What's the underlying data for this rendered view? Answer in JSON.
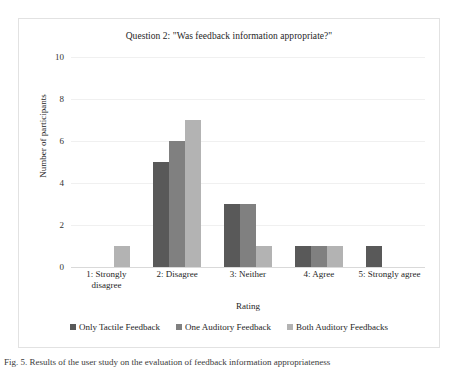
{
  "chart_data": {
    "type": "bar",
    "title": "Question 2: \"Was feedback information appropriate?\"",
    "xlabel": "Rating",
    "ylabel": "Number of participants",
    "categories": [
      "1: Strongly disagree",
      "2: Disagree",
      "3: Neither",
      "4: Agree",
      "5: Strongly agree"
    ],
    "series": [
      {
        "name": "Only Tactile Feedback",
        "color": "#595959",
        "values": [
          0,
          5,
          3,
          1,
          1
        ]
      },
      {
        "name": "One Auditory Feedback",
        "color": "#808080",
        "values": [
          0,
          6,
          3,
          1,
          0
        ]
      },
      {
        "name": "Both Auditory Feedbacks",
        "color": "#b3b3b3",
        "values": [
          1,
          7,
          1,
          1,
          0
        ]
      }
    ],
    "ylim": [
      0,
      10
    ],
    "yticks": [
      0,
      2,
      4,
      6,
      8,
      10
    ],
    "grid": true,
    "legend_position": "bottom"
  },
  "caption": {
    "text": "Fig. 5.  Results of the user study on the evaluation of feedback information appropriateness"
  }
}
